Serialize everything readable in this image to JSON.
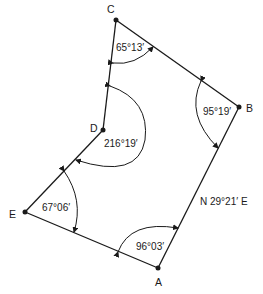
{
  "diagram": {
    "type": "traverse-polygon",
    "vertices": [
      {
        "id": "A",
        "label": "A",
        "x": 158,
        "y": 268,
        "lx": 155,
        "ly": 286
      },
      {
        "id": "B",
        "label": "B",
        "x": 239,
        "y": 107,
        "lx": 246,
        "ly": 112
      },
      {
        "id": "C",
        "label": "C",
        "x": 116,
        "y": 20,
        "lx": 107,
        "ly": 13
      },
      {
        "id": "D",
        "label": "D",
        "x": 103,
        "y": 130,
        "lx": 90,
        "ly": 132
      },
      {
        "id": "E",
        "label": "E",
        "x": 25,
        "y": 212,
        "lx": 9,
        "ly": 218
      }
    ],
    "angles": [
      {
        "vertex": "A",
        "label": "96°03′",
        "x": 118,
        "y": 246
      },
      {
        "vertex": "B",
        "label": "95°19′",
        "x": 203,
        "y": 115
      },
      {
        "vertex": "C",
        "label": "65°13′",
        "x": 116,
        "y": 51
      },
      {
        "vertex": "D",
        "label": "216°19′",
        "x": 104,
        "y": 147
      },
      {
        "vertex": "E",
        "label": "67°06′",
        "x": 42,
        "y": 211
      }
    ],
    "bearing": {
      "line": "AB",
      "label": "N 29°21′ E",
      "x": 200,
      "y": 204
    },
    "line_color": "#1a1a1a"
  }
}
